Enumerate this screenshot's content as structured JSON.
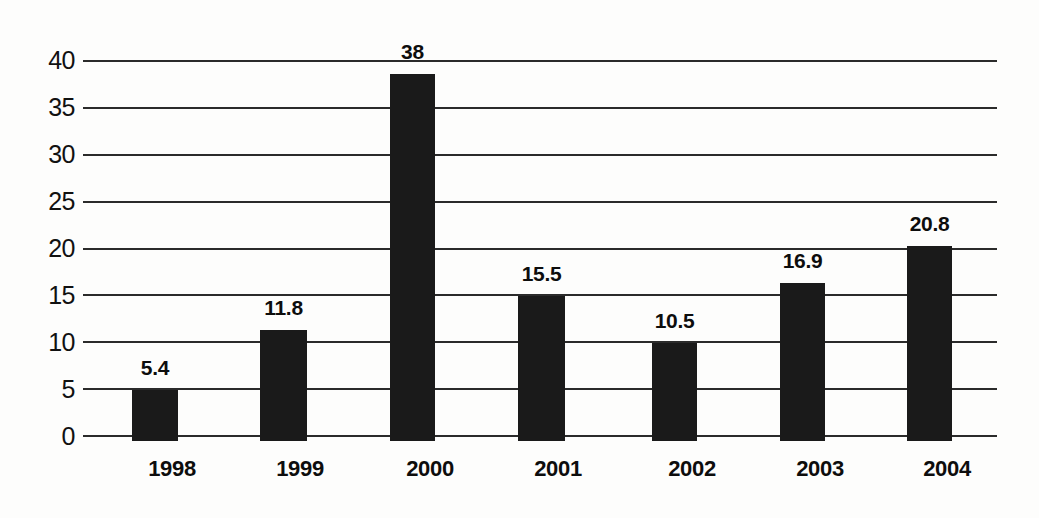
{
  "chart_data": {
    "type": "bar",
    "title": "",
    "subtitle": "",
    "xlabel": "",
    "ylabel": "",
    "categories": [
      "1998",
      "1999",
      "2000",
      "2001",
      "2002",
      "2003",
      "2004"
    ],
    "values": [
      5.4,
      11.8,
      38,
      15.5,
      10.5,
      16.9,
      20.8
    ],
    "value_labels": [
      "5.4",
      "11.8",
      "38",
      "15.5",
      "10.5",
      "16.9",
      "20.8"
    ],
    "ylim": [
      0,
      40
    ],
    "ytick_step": 5,
    "ytick_labels": [
      "40",
      "35",
      "30",
      "25",
      "20",
      "15",
      "10",
      "5",
      "0"
    ],
    "ytick_values": [
      40,
      35,
      30,
      25,
      20,
      15,
      10,
      5,
      0
    ],
    "grid": true,
    "grid_axis": "y",
    "legend": false,
    "legend_position": "none",
    "annotations": [],
    "colors": {
      "bar": "#1a1a1a",
      "gridline": "#2b2b2b",
      "text": "#0d0d0d",
      "background": "#fdfdfc"
    }
  }
}
